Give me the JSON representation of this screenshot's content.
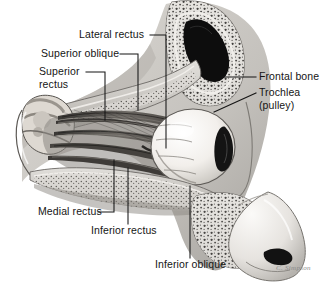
{
  "figure": {
    "background_color": "#ffffff",
    "ink_color": "#151515",
    "width": 336,
    "height": 289
  },
  "labels": [
    {
      "id": "lateral-rectus",
      "text": "Lateral rectus",
      "x": 79,
      "y": 31,
      "lines": 1
    },
    {
      "id": "superior-oblique",
      "text": "Superior oblique",
      "x": 41,
      "y": 50,
      "lines": 1
    },
    {
      "id": "superior-rectus",
      "text": "Superior",
      "text2": "rectus",
      "x": 39,
      "y": 68,
      "lines": 2
    },
    {
      "id": "frontal-bone",
      "text": "Frontal bone",
      "x": 259,
      "y": 73,
      "lines": 1
    },
    {
      "id": "trochlea",
      "text": "Trochlea",
      "text2": "(pulley)",
      "x": 259,
      "y": 89,
      "lines": 2
    },
    {
      "id": "medial-rectus",
      "text": "Medial rectus",
      "x": 38,
      "y": 209,
      "lines": 1
    },
    {
      "id": "inferior-rectus",
      "text": "Inferior rectus",
      "x": 91,
      "y": 228,
      "lines": 1
    },
    {
      "id": "inferior-oblique",
      "text": "Inferior oblique",
      "x": 155,
      "y": 262,
      "lines": 1
    }
  ],
  "signature": {
    "text": "C. Simpson"
  },
  "colors": {
    "bone_light": "#d8d6d2",
    "bone_mid": "#b9b6b1",
    "bone_shadow": "#8e8b86",
    "sinus_dark": "#111111",
    "muscle_dark": "#2e2c2a",
    "muscle_mid": "#5a5652",
    "sclera": "#f6f4f0",
    "iris": "#141414",
    "skin": "#cfccc7",
    "leader_line": "#151515"
  }
}
